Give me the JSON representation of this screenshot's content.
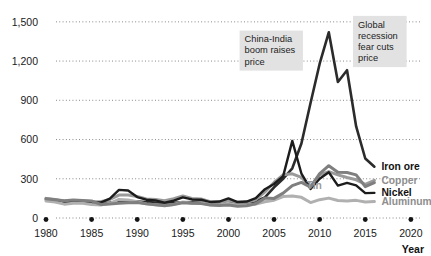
{
  "chart_data": {
    "type": "line",
    "title": "",
    "subtitle": "",
    "xlabel": "Year",
    "ylabel": "",
    "xlim": [
      1980,
      2021
    ],
    "ylim": [
      0,
      1560
    ],
    "grid": true,
    "grid_orientation": "horizontal",
    "legend_position": "right-inline",
    "x_ticks": [
      "1980",
      "1985",
      "1990",
      "1995",
      "2000",
      "2005",
      "2010",
      "2015",
      "2020"
    ],
    "x_tick_values": [
      1980,
      1985,
      1990,
      1995,
      2000,
      2005,
      2010,
      2015,
      2020
    ],
    "y_ticks": [
      "0",
      "300",
      "600",
      "900",
      "1,200",
      "1,500"
    ],
    "y_tick_values": [
      0,
      300,
      600,
      900,
      1200,
      1500
    ],
    "x": [
      1980,
      1981,
      1982,
      1983,
      1984,
      1985,
      1986,
      1987,
      1988,
      1989,
      1990,
      1991,
      1992,
      1993,
      1994,
      1995,
      1996,
      1997,
      1998,
      1999,
      2000,
      2001,
      2002,
      2003,
      2004,
      2005,
      2006,
      2007,
      2008,
      2009,
      2010,
      2011,
      2012,
      2013,
      2014,
      2015,
      2016
    ],
    "series": [
      {
        "name": "Iron ore",
        "color": "#2b2b2b",
        "width": 2.6,
        "label_color_name": "dark",
        "values": [
          138,
          132,
          126,
          122,
          120,
          118,
          116,
          118,
          124,
          128,
          126,
          122,
          118,
          114,
          116,
          120,
          122,
          120,
          116,
          112,
          116,
          114,
          116,
          128,
          158,
          235,
          300,
          380,
          570,
          880,
          1180,
          1420,
          1040,
          1130,
          700,
          455,
          392
        ]
      },
      {
        "name": "Copper",
        "color": "#9a9a9a",
        "width": 3.0,
        "label_color_name": "gray",
        "values": [
          150,
          142,
          128,
          134,
          130,
          126,
          124,
          142,
          175,
          176,
          165,
          145,
          142,
          132,
          148,
          168,
          150,
          146,
          124,
          120,
          135,
          120,
          120,
          140,
          200,
          272,
          330,
          338,
          310,
          240,
          330,
          355,
          330,
          310,
          292,
          258,
          288
        ]
      },
      {
        "name": "Nickel",
        "color": "#1c1c1c",
        "width": 2.4,
        "label_color_name": "dark",
        "values": [
          144,
          136,
          120,
          126,
          124,
          120,
          118,
          148,
          215,
          210,
          160,
          140,
          135,
          118,
          132,
          158,
          142,
          140,
          122,
          126,
          150,
          122,
          126,
          152,
          220,
          260,
          320,
          590,
          340,
          222,
          300,
          350,
          248,
          268,
          250,
          190,
          192
        ]
      },
      {
        "name": "Aluminum",
        "color": "#b0b0b0",
        "width": 3.0,
        "label_color_name": "gray",
        "values": [
          130,
          122,
          106,
          112,
          112,
          104,
          100,
          112,
          142,
          138,
          124,
          108,
          102,
          96,
          104,
          122,
          112,
          116,
          102,
          100,
          112,
          98,
          98,
          106,
          124,
          136,
          164,
          168,
          158,
          118,
          140,
          152,
          134,
          130,
          135,
          122,
          126
        ]
      },
      {
        "name": "Tin",
        "color": "#7f7f7f",
        "width": 3.0,
        "label_color_name": "gray",
        "values": [
          148,
          140,
          132,
          138,
          134,
          130,
          104,
          108,
          112,
          116,
          118,
          108,
          102,
          94,
          104,
          116,
          112,
          110,
          100,
          96,
          100,
          90,
          94,
          110,
          152,
          150,
          190,
          248,
          272,
          236,
          340,
          400,
          350,
          348,
          330,
          240,
          270
        ]
      }
    ],
    "inline_labels": [
      {
        "text": "Tin",
        "x_value": 2009.4,
        "y_value": 218
      }
    ],
    "annotations": [
      {
        "text": "China-India boom raises price",
        "lines": [
          "China-India",
          "boom raises",
          "price"
        ],
        "box_color": "#e2e2e2",
        "x_value": 2004.7,
        "y_value": 1280
      },
      {
        "text": "Global recession fear cuts price",
        "lines": [
          "Global",
          "recession",
          "fear cuts",
          "price"
        ],
        "box_color": "#e2e2e2",
        "x_value": 2016.6,
        "y_value": 1350
      }
    ]
  },
  "colors": {
    "background": "#ffffff",
    "grid": "#6e6e6e",
    "text": "#1a1a1a",
    "iron_ore": "#2b2b2b",
    "copper": "#9a9a9a",
    "nickel": "#1c1c1c",
    "aluminum": "#b0b0b0",
    "tin": "#7f7f7f",
    "annotation_box": "#e2e2e2"
  }
}
